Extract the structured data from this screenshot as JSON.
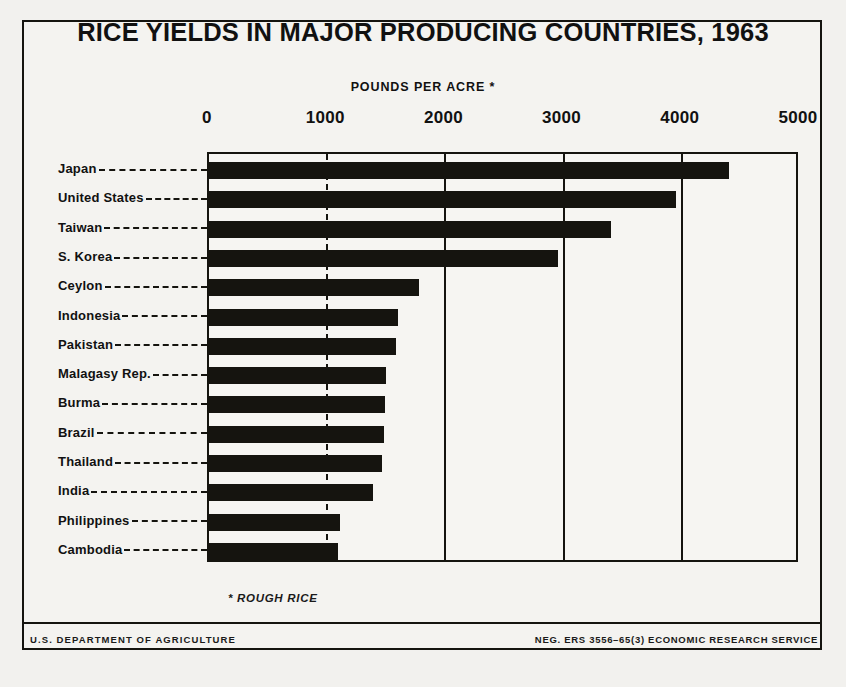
{
  "poster": {
    "title": "RICE YIELDS IN MAJOR PRODUCING COUNTRIES, 1963",
    "units_caption": "POUNDS PER ACRE *",
    "footnote": "* ROUGH RICE",
    "footer_left": "U.S. DEPARTMENT OF AGRICULTURE",
    "footer_right": "NEG. ERS 3556–65(3) ECONOMIC RESEARCH SERVICE",
    "colors": {
      "ink": "#15140f",
      "paper": "#f4f3f0",
      "bar": "#15140f"
    }
  },
  "chart_data": {
    "type": "bar",
    "orientation": "horizontal",
    "title": "RICE YIELDS IN MAJOR PRODUCING COUNTRIES, 1963",
    "xlabel": "POUNDS PER ACRE *",
    "ylabel": "",
    "xlim": [
      0,
      5000
    ],
    "xticks": [
      0,
      1000,
      2000,
      3000,
      4000,
      5000
    ],
    "xtick_labels": [
      "0",
      "1000",
      "2000",
      "3000",
      "4000",
      "5000"
    ],
    "grid": true,
    "grid_axis": "x",
    "legend": false,
    "annotations": [
      "* ROUGH RICE"
    ],
    "categories": [
      "Japan",
      "United States",
      "Taiwan",
      "S. Korea",
      "Ceylon",
      "Indonesia",
      "Pakistan",
      "Malagasy Rep.",
      "Burma",
      "Brazil",
      "Thailand",
      "India",
      "Philippines",
      "Cambodia"
    ],
    "values": [
      4400,
      3950,
      3400,
      2950,
      1780,
      1600,
      1580,
      1500,
      1490,
      1480,
      1460,
      1390,
      1110,
      1090
    ],
    "series": [
      {
        "name": "Rice yield, pounds per acre (rough rice)",
        "values": [
          4400,
          3950,
          3400,
          2950,
          1780,
          1600,
          1580,
          1500,
          1490,
          1480,
          1460,
          1390,
          1110,
          1090
        ]
      }
    ]
  }
}
